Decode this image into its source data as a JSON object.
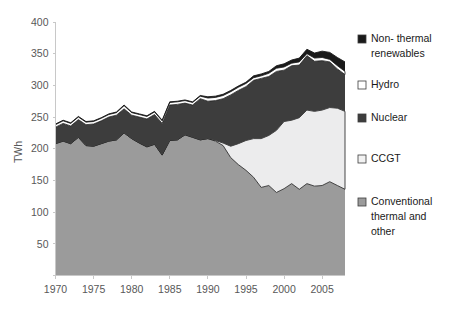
{
  "chart_data": {
    "type": "area",
    "stacked": true,
    "title": "",
    "subtitle": "",
    "xlabel": "",
    "ylabel": "TWh",
    "xlim": [
      1970,
      2008
    ],
    "ylim": [
      0,
      400
    ],
    "ytick_values": [
      0,
      50,
      100,
      150,
      200,
      250,
      300,
      350,
      400
    ],
    "ytick_labels": [
      "",
      "50",
      "100",
      "150",
      "200",
      "250",
      "300",
      "350",
      "400"
    ],
    "xtick_values": [
      1970,
      1975,
      1980,
      1985,
      1990,
      1995,
      2000,
      2005
    ],
    "xtick_labels": [
      "1970",
      "1975",
      "1980",
      "1985",
      "1990",
      "1995",
      "2000",
      "2005"
    ],
    "grid": false,
    "legend_position": "right",
    "x": [
      1970,
      1971,
      1972,
      1973,
      1974,
      1975,
      1976,
      1977,
      1978,
      1979,
      1980,
      1981,
      1982,
      1983,
      1984,
      1985,
      1986,
      1987,
      1988,
      1989,
      1990,
      1991,
      1992,
      1993,
      1994,
      1995,
      1996,
      1997,
      1998,
      1999,
      2000,
      2001,
      2002,
      2003,
      2004,
      2005,
      2006,
      2007,
      2008
    ],
    "series": [
      {
        "name": "Conventional thermal and other",
        "color": "#9b9b9b",
        "values": [
          208,
          212,
          208,
          218,
          205,
          204,
          208,
          212,
          214,
          225,
          216,
          209,
          203,
          207,
          190,
          213,
          214,
          222,
          218,
          214,
          216,
          212,
          205,
          186,
          175,
          166,
          155,
          139,
          142,
          131,
          137,
          145,
          136,
          145,
          141,
          142,
          148,
          142,
          136
        ]
      },
      {
        "name": "CCGT",
        "color": "#ececed",
        "values": [
          0,
          0,
          0,
          0,
          0,
          0,
          0,
          0,
          0,
          0,
          0,
          0,
          0,
          0,
          0,
          0,
          0,
          0,
          0,
          0,
          0,
          1,
          4,
          18,
          33,
          47,
          61,
          77,
          79,
          98,
          106,
          100,
          113,
          116,
          118,
          119,
          117,
          122,
          123
        ]
      },
      {
        "name": "Nuclear",
        "color": "#3d3d3d",
        "values": [
          26,
          28,
          28,
          28,
          33,
          35,
          36,
          38,
          39,
          38,
          37,
          41,
          44,
          47,
          50,
          56,
          56,
          50,
          51,
          65,
          59,
          63,
          70,
          81,
          84,
          85,
          92,
          95,
          93,
          93,
          81,
          86,
          83,
          86,
          79,
          78,
          72,
          62,
          58
        ]
      },
      {
        "name": "Hydro",
        "color": "#ffffff",
        "values": [
          4,
          4,
          4,
          4,
          4,
          4,
          4,
          4,
          4,
          5,
          4,
          4,
          4,
          4,
          4,
          4,
          4,
          4,
          4,
          4,
          5,
          5,
          5,
          5,
          5,
          5,
          4,
          4,
          5,
          5,
          5,
          4,
          5,
          3,
          5,
          5,
          4,
          5,
          5
        ]
      },
      {
        "name": "Non- thermal renewables",
        "color": "#1a1a1a",
        "values": [
          1,
          1,
          1,
          1,
          1,
          1,
          1,
          1,
          1,
          1,
          1,
          1,
          1,
          1,
          1,
          1,
          1,
          1,
          1,
          1,
          2,
          2,
          2,
          2,
          2,
          2,
          3,
          3,
          3,
          4,
          5,
          5,
          6,
          7,
          8,
          10,
          11,
          13,
          15
        ]
      }
    ],
    "legend_entries": [
      {
        "label_line1": "Non- thermal",
        "label_line2": "renewables",
        "color": "#1a1a1a"
      },
      {
        "label_line1": "Hydro",
        "label_line2": "",
        "color": "#ffffff"
      },
      {
        "label_line1": "Nuclear",
        "label_line2": "",
        "color": "#3d3d3d"
      },
      {
        "label_line1": "CCGT",
        "label_line2": "",
        "color": "#f2f2f2"
      },
      {
        "label_line1": "Conventional",
        "label_line2": "thermal and",
        "label_line3": "other",
        "color": "#9b9b9b"
      }
    ]
  },
  "axes": {
    "y_axis_title": "TWh"
  }
}
